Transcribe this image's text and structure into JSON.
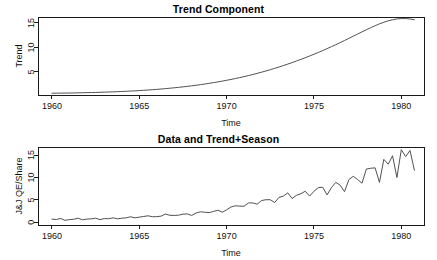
{
  "figure": {
    "width": 437,
    "height": 260,
    "background": "#ffffff",
    "line_color": "#3d3d3d",
    "axis_color": "#1a1a1a"
  },
  "panels": [
    {
      "name": "trend",
      "title": "Trend Component",
      "xlabel": "Time",
      "ylabel": "Trend"
    },
    {
      "name": "data-trend-season",
      "title": "Data and Trend+Season",
      "xlabel": "Time",
      "ylabel": "J&J QE/Share"
    }
  ],
  "chart_data": [
    {
      "type": "line",
      "title": "Trend Component",
      "xlabel": "Time",
      "ylabel": "Trend",
      "xlim": [
        1959.2,
        1981.3
      ],
      "ylim": [
        0.3,
        16.2
      ],
      "xticks": [
        1960,
        1965,
        1970,
        1975,
        1980
      ],
      "yticks": [
        5,
        10,
        15
      ],
      "grid": false,
      "legend": null,
      "series": [
        {
          "name": "Trend",
          "x": [
            1960.0,
            1960.25,
            1960.5,
            1960.75,
            1961.0,
            1961.25,
            1961.5,
            1961.75,
            1962.0,
            1962.25,
            1962.5,
            1962.75,
            1963.0,
            1963.25,
            1963.5,
            1963.75,
            1964.0,
            1964.25,
            1964.5,
            1964.75,
            1965.0,
            1965.25,
            1965.5,
            1965.75,
            1966.0,
            1966.25,
            1966.5,
            1966.75,
            1967.0,
            1967.25,
            1967.5,
            1967.75,
            1968.0,
            1968.25,
            1968.5,
            1968.75,
            1969.0,
            1969.25,
            1969.5,
            1969.75,
            1970.0,
            1970.25,
            1970.5,
            1970.75,
            1971.0,
            1971.25,
            1971.5,
            1971.75,
            1972.0,
            1972.25,
            1972.5,
            1972.75,
            1973.0,
            1973.25,
            1973.5,
            1973.75,
            1974.0,
            1974.25,
            1974.5,
            1974.75,
            1975.0,
            1975.25,
            1975.5,
            1975.75,
            1976.0,
            1976.25,
            1976.5,
            1976.75,
            1977.0,
            1977.25,
            1977.5,
            1977.75,
            1978.0,
            1978.25,
            1978.5,
            1978.75,
            1979.0,
            1979.25,
            1979.5,
            1979.75,
            1980.0,
            1980.25,
            1980.5,
            1980.75
          ],
          "y": [
            0.66,
            0.67,
            0.68,
            0.69,
            0.71,
            0.72,
            0.74,
            0.76,
            0.78,
            0.8,
            0.82,
            0.85,
            0.88,
            0.91,
            0.94,
            0.98,
            1.02,
            1.06,
            1.1,
            1.15,
            1.2,
            1.26,
            1.32,
            1.38,
            1.45,
            1.52,
            1.6,
            1.68,
            1.77,
            1.86,
            1.96,
            2.06,
            2.17,
            2.29,
            2.41,
            2.54,
            2.68,
            2.82,
            2.97,
            3.13,
            3.3,
            3.47,
            3.66,
            3.85,
            4.05,
            4.26,
            4.48,
            4.71,
            4.95,
            5.2,
            5.46,
            5.73,
            6.01,
            6.3,
            6.6,
            6.91,
            7.23,
            7.56,
            7.9,
            8.25,
            8.61,
            8.98,
            9.36,
            9.75,
            10.15,
            10.56,
            10.98,
            11.41,
            11.85,
            12.29,
            12.73,
            13.17,
            13.6,
            14.02,
            14.42,
            14.8,
            15.13,
            15.42,
            15.64,
            15.8,
            15.88,
            15.88,
            15.8,
            15.64
          ]
        }
      ]
    },
    {
      "type": "line",
      "title": "Data and Trend+Season",
      "xlabel": "Time",
      "ylabel": "J&J QE/Share",
      "xlim": [
        1959.2,
        1981.3
      ],
      "ylim": [
        -0.6,
        16.8
      ],
      "xticks": [
        1960,
        1965,
        1970,
        1975,
        1980
      ],
      "yticks": [
        0,
        5,
        10,
        15
      ],
      "grid": false,
      "legend": null,
      "series": [
        {
          "name": "J&J QE/Share",
          "x": [
            1960.0,
            1960.25,
            1960.5,
            1960.75,
            1961.0,
            1961.25,
            1961.5,
            1961.75,
            1962.0,
            1962.25,
            1962.5,
            1962.75,
            1963.0,
            1963.25,
            1963.5,
            1963.75,
            1964.0,
            1964.25,
            1964.5,
            1964.75,
            1965.0,
            1965.25,
            1965.5,
            1965.75,
            1966.0,
            1966.25,
            1966.5,
            1966.75,
            1967.0,
            1967.25,
            1967.5,
            1967.75,
            1968.0,
            1968.25,
            1968.5,
            1968.75,
            1969.0,
            1969.25,
            1969.5,
            1969.75,
            1970.0,
            1970.25,
            1970.5,
            1970.75,
            1971.0,
            1971.25,
            1971.5,
            1971.75,
            1972.0,
            1972.25,
            1972.5,
            1972.75,
            1973.0,
            1973.25,
            1973.5,
            1973.75,
            1974.0,
            1974.25,
            1974.5,
            1974.75,
            1975.0,
            1975.25,
            1975.5,
            1975.75,
            1976.0,
            1976.25,
            1976.5,
            1976.75,
            1977.0,
            1977.25,
            1977.5,
            1977.75,
            1978.0,
            1978.25,
            1978.5,
            1978.75,
            1979.0,
            1979.25,
            1979.5,
            1979.75,
            1980.0,
            1980.25,
            1980.5,
            1980.75
          ],
          "y": [
            0.71,
            0.63,
            0.85,
            0.44,
            0.61,
            0.69,
            0.92,
            0.55,
            0.72,
            0.77,
            0.92,
            0.6,
            0.83,
            0.8,
            1.0,
            0.77,
            0.92,
            1.0,
            1.24,
            1.0,
            1.16,
            1.3,
            1.45,
            1.25,
            1.26,
            1.38,
            1.86,
            1.56,
            1.53,
            1.59,
            1.83,
            1.86,
            1.53,
            2.07,
            2.34,
            2.25,
            2.16,
            2.43,
            2.7,
            2.25,
            2.79,
            3.42,
            3.69,
            3.6,
            3.6,
            4.32,
            4.32,
            4.05,
            4.86,
            5.04,
            5.04,
            4.41,
            5.58,
            5.85,
            6.57,
            5.31,
            6.03,
            6.39,
            6.93,
            5.85,
            6.93,
            7.74,
            7.83,
            6.12,
            7.74,
            8.91,
            8.28,
            6.84,
            9.54,
            10.26,
            9.54,
            8.73,
            11.88,
            12.06,
            12.15,
            8.91,
            14.04,
            12.96,
            14.85,
            9.99,
            16.2,
            14.67,
            16.02,
            11.61
          ]
        }
      ]
    }
  ]
}
